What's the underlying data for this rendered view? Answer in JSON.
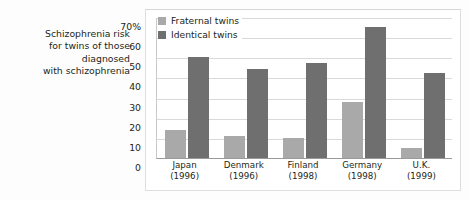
{
  "caption": {
    "lines": [
      "Schizophrenia risk",
      "for twins of those",
      "diagnosed",
      "with schizophrenia"
    ]
  },
  "legend": {
    "items": [
      {
        "label": "Fraternal twins",
        "color": "#a9a9a9",
        "key": "fraternal"
      },
      {
        "label": "Identical twins",
        "color": "#6f6f6f",
        "key": "identical"
      }
    ]
  },
  "axes": {
    "y_ticks": [
      "70%",
      "60",
      "50",
      "40",
      "30",
      "20",
      "10",
      "0"
    ],
    "x_labels": [
      {
        "country": "Japan",
        "year": "(1996)"
      },
      {
        "country": "Denmark",
        "year": "(1996)"
      },
      {
        "country": "Finland",
        "year": "(1998)"
      },
      {
        "country": "Germany",
        "year": "(1998)"
      },
      {
        "country": "U.K.",
        "year": "(1999)"
      }
    ]
  },
  "chart_data": {
    "type": "bar",
    "title": "Schizophrenia risk for twins of those diagnosed with schizophrenia",
    "xlabel": "",
    "ylabel": "",
    "ylim": [
      0,
      70
    ],
    "ytick_step": 10,
    "grid": true,
    "legend_position": "top-left-inside",
    "categories": [
      "Japan (1996)",
      "Denmark (1996)",
      "Finland (1998)",
      "Germany (1998)",
      "U.K. (1999)"
    ],
    "series": [
      {
        "name": "Fraternal twins",
        "color": "#a9a9a9",
        "values": [
          14,
          11,
          10,
          28,
          5
        ]
      },
      {
        "name": "Identical twins",
        "color": "#6f6f6f",
        "values": [
          50,
          44,
          47,
          65,
          42
        ]
      }
    ]
  }
}
